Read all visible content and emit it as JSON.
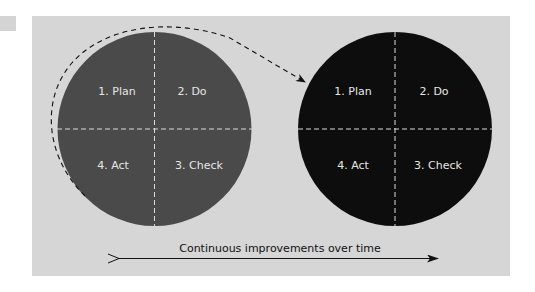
{
  "colors": {
    "background": "#ffffff",
    "panel": "#d6d6d6",
    "circle_before": "#4a4a4a",
    "circle_after": "#0d0d0d",
    "divider": "#e0e0e0",
    "label_text": "#e6e6e6",
    "arrow": "#111111"
  },
  "cycles": [
    {
      "id": "before",
      "quadrants": {
        "top_left": "1. Plan",
        "top_right": "2. Do",
        "bottom_right": "3. Check",
        "bottom_left": "4. Act"
      }
    },
    {
      "id": "after",
      "quadrants": {
        "top_left": "1. Plan",
        "top_right": "2. Do",
        "bottom_right": "3. Check",
        "bottom_left": "4. Act"
      }
    }
  ],
  "timeline": {
    "label": "Continuous improvements over time"
  }
}
